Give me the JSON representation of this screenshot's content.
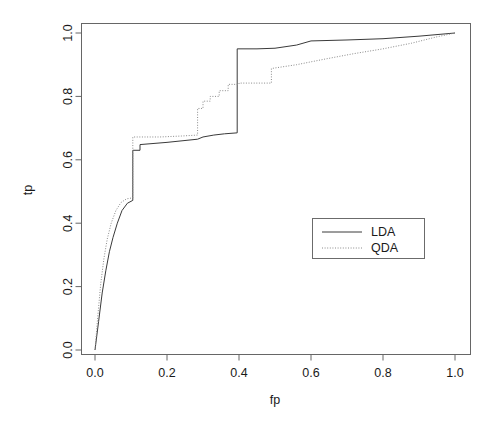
{
  "chart_data": {
    "type": "line",
    "title": "",
    "subtitle": "",
    "xlabel": "fp",
    "ylabel": "tp",
    "xlim": [
      0.0,
      1.0
    ],
    "ylim": [
      0.0,
      1.0
    ],
    "grid": false,
    "legend_position": "center-right",
    "xticks": [
      0.0,
      0.2,
      0.4,
      0.6,
      0.8,
      1.0
    ],
    "xtick_labels": [
      "0.0",
      "0.2",
      "0.4",
      "0.6",
      "0.8",
      "1.0"
    ],
    "yticks": [
      0.0,
      0.2,
      0.4,
      0.6,
      0.8,
      1.0
    ],
    "ytick_labels": [
      "0.0",
      "0.2",
      "0.4",
      "0.6",
      "0.8",
      "1.0"
    ],
    "series": [
      {
        "name": "LDA",
        "linestyle": "solid",
        "color": "#3a3a3a",
        "points": [
          [
            0.0,
            0.0
          ],
          [
            0.01,
            0.09
          ],
          [
            0.02,
            0.18
          ],
          [
            0.03,
            0.25
          ],
          [
            0.04,
            0.31
          ],
          [
            0.05,
            0.355
          ],
          [
            0.062,
            0.4
          ],
          [
            0.075,
            0.44
          ],
          [
            0.09,
            0.463
          ],
          [
            0.105,
            0.472
          ],
          [
            0.105,
            0.63
          ],
          [
            0.125,
            0.63
          ],
          [
            0.125,
            0.648
          ],
          [
            0.2,
            0.655
          ],
          [
            0.285,
            0.665
          ],
          [
            0.3,
            0.672
          ],
          [
            0.33,
            0.678
          ],
          [
            0.36,
            0.682
          ],
          [
            0.395,
            0.685
          ],
          [
            0.395,
            0.95
          ],
          [
            0.45,
            0.95
          ],
          [
            0.5,
            0.952
          ],
          [
            0.56,
            0.962
          ],
          [
            0.6,
            0.975
          ],
          [
            0.7,
            0.978
          ],
          [
            0.8,
            0.982
          ],
          [
            0.9,
            0.99
          ],
          [
            1.0,
            1.0
          ]
        ]
      },
      {
        "name": "QDA",
        "linestyle": "dotted",
        "color": "#8a8a8a",
        "points": [
          [
            0.0,
            0.0
          ],
          [
            0.008,
            0.11
          ],
          [
            0.016,
            0.21
          ],
          [
            0.025,
            0.29
          ],
          [
            0.034,
            0.35
          ],
          [
            0.045,
            0.4
          ],
          [
            0.058,
            0.44
          ],
          [
            0.072,
            0.465
          ],
          [
            0.088,
            0.477
          ],
          [
            0.105,
            0.48
          ],
          [
            0.105,
            0.672
          ],
          [
            0.18,
            0.672
          ],
          [
            0.24,
            0.675
          ],
          [
            0.285,
            0.678
          ],
          [
            0.285,
            0.762
          ],
          [
            0.3,
            0.762
          ],
          [
            0.3,
            0.785
          ],
          [
            0.32,
            0.785
          ],
          [
            0.32,
            0.8
          ],
          [
            0.345,
            0.8
          ],
          [
            0.345,
            0.818
          ],
          [
            0.37,
            0.818
          ],
          [
            0.37,
            0.838
          ],
          [
            0.4,
            0.838
          ],
          [
            0.4,
            0.842
          ],
          [
            0.49,
            0.842
          ],
          [
            0.49,
            0.888
          ],
          [
            0.56,
            0.9
          ],
          [
            0.64,
            0.918
          ],
          [
            0.72,
            0.935
          ],
          [
            0.8,
            0.95
          ],
          [
            0.88,
            0.968
          ],
          [
            0.95,
            0.988
          ],
          [
            1.0,
            1.0
          ]
        ]
      }
    ]
  },
  "axes": {
    "x_label": "fp",
    "y_label": "tp"
  },
  "legend": {
    "entries": [
      {
        "label": "LDA",
        "style": "solid"
      },
      {
        "label": "QDA",
        "style": "dotted"
      }
    ]
  }
}
